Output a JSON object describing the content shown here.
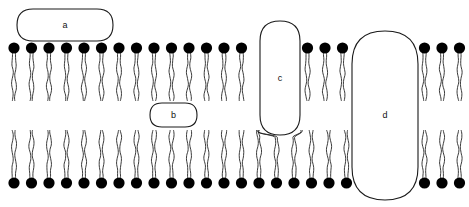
{
  "figure": {
    "type": "diagram",
    "width": 469,
    "height": 207,
    "background_color": "#ffffff",
    "stroke_color": "#1a1a1a",
    "head_fill": "#000000"
  },
  "labels": {
    "a": "a",
    "b": "b",
    "c": "c",
    "d": "d"
  },
  "structures": {
    "peripheral_protein_top": {
      "label_key": "a",
      "shape": "rounded-ellipse",
      "x": 17,
      "y": 9,
      "w": 96,
      "h": 32,
      "fill": "#ffffff"
    },
    "peripheral_protein_inner": {
      "label_key": "b",
      "shape": "rounded-ellipse",
      "x": 150,
      "y": 103,
      "w": 47,
      "h": 24,
      "fill": "#ffffff"
    },
    "integral_protein_partial": {
      "label_key": "c",
      "shape": "rounded-rect",
      "x": 260,
      "y": 21,
      "w": 40,
      "h": 114,
      "fill": "#ffffff"
    },
    "transmembrane_protein": {
      "label_key": "d",
      "shape": "rounded-rect",
      "x": 352,
      "y": 31,
      "w": 66,
      "h": 169,
      "fill": "#ffffff"
    }
  },
  "bilayer": {
    "upper_leaflet": {
      "head_center_y": 48,
      "head_radius": 5.6,
      "tail_start_y": 53,
      "tail_end_y": 101,
      "head_x_positions": [
        14,
        31.5,
        49,
        66.5,
        84,
        101.5,
        119,
        136.5,
        154,
        171.5,
        189,
        206.5,
        224,
        241.5,
        307.5,
        325,
        342.5,
        424.5,
        442,
        459.5
      ]
    },
    "lower_leaflet": {
      "head_center_y": 183,
      "head_radius": 5.6,
      "tail_start_y": 178,
      "tail_end_y": 130,
      "head_x_positions": [
        14,
        31.5,
        49,
        66.5,
        84,
        101.5,
        119,
        136.5,
        154,
        171.5,
        189,
        206.5,
        224,
        241.5,
        259,
        276.5,
        294,
        311.5,
        329,
        346.5,
        424.5,
        442,
        459.5
      ]
    }
  }
}
